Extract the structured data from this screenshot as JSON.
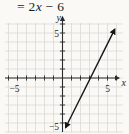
{
  "page": {
    "background": "#faf9f6"
  },
  "equation": {
    "prefix": "= 2",
    "variable": "x",
    "suffix": " − 6"
  },
  "chart_data": {
    "type": "line",
    "title_fragment": "= 2x − 6",
    "xlabel": "x",
    "ylabel": "y",
    "xlim": [
      -6.3,
      6.8
    ],
    "ylim": [
      -6.2,
      7.0
    ],
    "grid": true,
    "grid_step": 1,
    "line": {
      "equation": "y = 2x - 6",
      "slope": 2,
      "intercept": -6,
      "x_intercept": 3,
      "segment_points": [
        [
          0.35,
          -5.5
        ],
        [
          5.8,
          5.4
        ]
      ],
      "arrows_both_ends": true
    },
    "x_tick_labels": [
      {
        "value": -5,
        "label": "−5"
      },
      {
        "value": 5,
        "label": "5"
      }
    ],
    "y_tick_labels": [
      {
        "value": 5,
        "label": "5"
      },
      {
        "value": -5,
        "label": "−5"
      }
    ],
    "colors": {
      "axis": "#2b2b2b",
      "grid": "#d7d6d1",
      "line": "#161616",
      "label": "#1f1f1f"
    }
  }
}
